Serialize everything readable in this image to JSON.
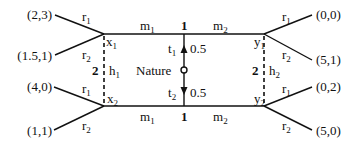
{
  "diagram": {
    "type": "game-tree",
    "nature": {
      "label": "Nature",
      "moves": [
        {
          "label": "t",
          "sub": "1",
          "prob": "0.5"
        },
        {
          "label": "t",
          "sub": "2",
          "prob": "0.5"
        }
      ]
    },
    "player1": {
      "label": "1",
      "nodes": [
        {
          "label": "y",
          "sub": "1"
        },
        {
          "label": "y",
          "sub": "2"
        }
      ],
      "actions": [
        {
          "label": "m",
          "sub": "1"
        },
        {
          "label": "m",
          "sub": "2"
        }
      ]
    },
    "player2": {
      "label": "2",
      "nodes": [
        {
          "label": "x",
          "sub": "1"
        },
        {
          "label": "x",
          "sub": "2"
        },
        {
          "label": "y",
          "sub": "1"
        },
        {
          "label": "y",
          "sub": "2"
        }
      ],
      "info_sets": [
        {
          "label": "h",
          "sub": "1"
        },
        {
          "label": "h",
          "sub": "2"
        }
      ],
      "actions": [
        {
          "label": "r",
          "sub": "1"
        },
        {
          "label": "r",
          "sub": "2"
        }
      ]
    },
    "payoffs": {
      "x1_r1": "(2,3)",
      "x1_r2": "(1.5,1)",
      "x2_r1": "(4,0)",
      "x2_r2": "(1,1)",
      "y1_r1": "(0,0)",
      "y1_r2": "(5,1)",
      "y2_r1": "(0,2)",
      "y2_r2": "(5,0)"
    },
    "colors": {
      "line": "#111111",
      "background": "#ffffff"
    }
  }
}
